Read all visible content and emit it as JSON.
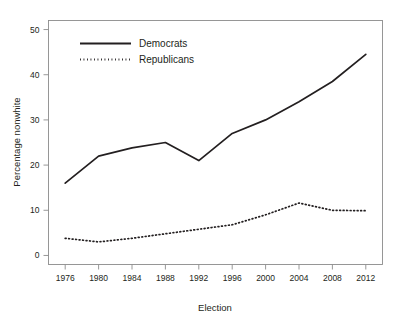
{
  "chart_data": {
    "type": "line",
    "title": "",
    "xlabel": "Election",
    "ylabel": "Percentage nonwhite",
    "x": [
      1976,
      1980,
      1984,
      1988,
      1992,
      1996,
      2000,
      2004,
      2008,
      2012
    ],
    "xtick_labels": [
      "1976",
      "1980",
      "1984",
      "1988",
      "1992",
      "1996",
      "2000",
      "2004",
      "2008",
      "2012"
    ],
    "ytick_labels": [
      "0",
      "10",
      "20",
      "30",
      "40",
      "50"
    ],
    "yticks": [
      0,
      10,
      20,
      30,
      40,
      50
    ],
    "xlim": [
      1974,
      2014
    ],
    "ylim": [
      -2,
      52
    ],
    "grid": false,
    "legend_position": "upper-left-inside",
    "series": [
      {
        "name": "Democrats",
        "style": "solid",
        "color": "#231f20",
        "values": [
          16.0,
          22.0,
          23.8,
          25.0,
          21.0,
          27.0,
          30.0,
          34.0,
          38.5,
          44.5
        ]
      },
      {
        "name": "Republicans",
        "style": "dotted",
        "color": "#231f20",
        "values": [
          3.8,
          3.0,
          3.8,
          4.8,
          5.8,
          6.8,
          9.0,
          11.6,
          10.0,
          9.9
        ]
      }
    ]
  },
  "legend": {
    "entries": [
      {
        "label": "Democrats"
      },
      {
        "label": "Republicans"
      }
    ]
  },
  "axes": {
    "x_title": "Election",
    "y_title": "Percentage nonwhite"
  }
}
